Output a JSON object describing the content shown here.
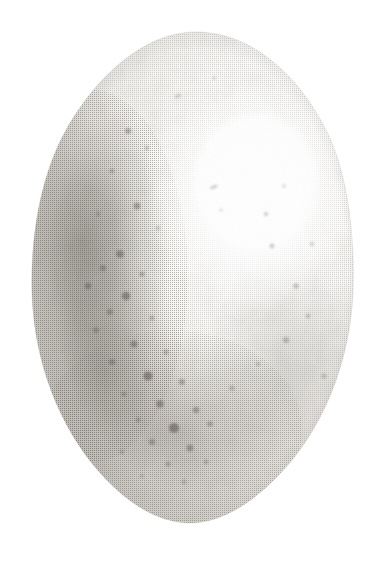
{
  "image": {
    "title": "Bird Egg Specimen Illustration",
    "subject": "egg",
    "style": "stipple engraving / halftone lithograph",
    "medium": "monochrome print",
    "caption": "",
    "background_color": "#ffffff",
    "canvas": {
      "width": 381,
      "height": 563
    }
  },
  "egg": {
    "name": "egg-body",
    "outline": {
      "top_y": 32,
      "bottom_y": 523,
      "left_x": 32,
      "right_x": 353,
      "widest_y": 300,
      "apex_x": 196,
      "base_x": 190,
      "shape": "ovoid, narrow rounded apex at top, broad rounded base at bottom"
    },
    "shell_base_color": "#e9e7e3",
    "ink_color": "#585550",
    "lighting": {
      "source": "upper right",
      "highlight_center_x": 252,
      "highlight_center_y": 196,
      "highlight_radius_x": 105,
      "highlight_radius_y": 115,
      "highlight_color": "#ffffff"
    },
    "shadow": {
      "name": "left-limb-shadow",
      "center_x": 78,
      "center_y": 240,
      "darkest_value": "#9a968f",
      "description": "deep graded shadow down the left limb, fading toward base"
    },
    "terminator": {
      "description": "soft diagonal tonal transition running from upper-left shoulder down to lower-right base"
    },
    "speckles": {
      "description": "irregular dark brown-grey maculations, densest over the lower-left and basal third, sparse near the apex and the highlight",
      "color_dark": "#5d564d",
      "color_mid": "#8a8279",
      "count": 46,
      "points": [
        {
          "x": 128,
          "y": 131,
          "r": 3.0,
          "o": 0.4
        },
        {
          "x": 147,
          "y": 148,
          "r": 2.0,
          "o": 0.3
        },
        {
          "x": 112,
          "y": 171,
          "r": 2.4,
          "o": 0.34
        },
        {
          "x": 137,
          "y": 206,
          "r": 3.4,
          "o": 0.46
        },
        {
          "x": 98,
          "y": 214,
          "r": 2.2,
          "o": 0.3
        },
        {
          "x": 158,
          "y": 228,
          "r": 2.0,
          "o": 0.28
        },
        {
          "x": 120,
          "y": 254,
          "r": 3.8,
          "o": 0.52
        },
        {
          "x": 103,
          "y": 268,
          "r": 3.0,
          "o": 0.44
        },
        {
          "x": 142,
          "y": 274,
          "r": 2.6,
          "o": 0.38
        },
        {
          "x": 88,
          "y": 286,
          "r": 3.2,
          "o": 0.48
        },
        {
          "x": 126,
          "y": 296,
          "r": 4.2,
          "o": 0.55
        },
        {
          "x": 110,
          "y": 312,
          "r": 3.0,
          "o": 0.42
        },
        {
          "x": 152,
          "y": 318,
          "r": 2.4,
          "o": 0.34
        },
        {
          "x": 96,
          "y": 330,
          "r": 2.8,
          "o": 0.4
        },
        {
          "x": 134,
          "y": 344,
          "r": 3.6,
          "o": 0.5
        },
        {
          "x": 166,
          "y": 352,
          "r": 2.6,
          "o": 0.36
        },
        {
          "x": 112,
          "y": 362,
          "r": 3.0,
          "o": 0.44
        },
        {
          "x": 148,
          "y": 376,
          "r": 4.6,
          "o": 0.58
        },
        {
          "x": 182,
          "y": 382,
          "r": 3.0,
          "o": 0.42
        },
        {
          "x": 124,
          "y": 394,
          "r": 2.6,
          "o": 0.36
        },
        {
          "x": 160,
          "y": 404,
          "r": 3.8,
          "o": 0.52
        },
        {
          "x": 196,
          "y": 410,
          "r": 3.2,
          "o": 0.44
        },
        {
          "x": 138,
          "y": 420,
          "r": 2.4,
          "o": 0.34
        },
        {
          "x": 174,
          "y": 428,
          "r": 5.0,
          "o": 0.6
        },
        {
          "x": 210,
          "y": 424,
          "r": 2.8,
          "o": 0.38
        },
        {
          "x": 152,
          "y": 442,
          "r": 3.0,
          "o": 0.42
        },
        {
          "x": 190,
          "y": 448,
          "r": 3.4,
          "o": 0.46
        },
        {
          "x": 122,
          "y": 452,
          "r": 2.2,
          "o": 0.3
        },
        {
          "x": 168,
          "y": 464,
          "r": 2.6,
          "o": 0.34
        },
        {
          "x": 206,
          "y": 462,
          "r": 2.4,
          "o": 0.32
        },
        {
          "x": 142,
          "y": 476,
          "r": 2.0,
          "o": 0.28
        },
        {
          "x": 184,
          "y": 482,
          "r": 2.2,
          "o": 0.3
        },
        {
          "x": 232,
          "y": 388,
          "r": 2.6,
          "o": 0.34
        },
        {
          "x": 258,
          "y": 364,
          "r": 2.2,
          "o": 0.3
        },
        {
          "x": 286,
          "y": 340,
          "r": 3.0,
          "o": 0.36
        },
        {
          "x": 308,
          "y": 316,
          "r": 2.4,
          "o": 0.3
        },
        {
          "x": 296,
          "y": 286,
          "r": 2.8,
          "o": 0.32
        },
        {
          "x": 272,
          "y": 246,
          "r": 2.4,
          "o": 0.3
        },
        {
          "x": 266,
          "y": 214,
          "r": 2.2,
          "o": 0.28
        },
        {
          "x": 284,
          "y": 186,
          "r": 1.8,
          "o": 0.24
        },
        {
          "x": 221,
          "y": 210,
          "r": 1.6,
          "o": 0.22
        },
        {
          "x": 214,
          "y": 187,
          "r": 2.0,
          "o": 0.26
        },
        {
          "x": 178,
          "y": 96,
          "r": 2.0,
          "o": 0.26
        },
        {
          "x": 214,
          "y": 78,
          "r": 1.8,
          "o": 0.22
        },
        {
          "x": 312,
          "y": 244,
          "r": 2.2,
          "o": 0.26
        },
        {
          "x": 324,
          "y": 376,
          "r": 2.6,
          "o": 0.3
        }
      ]
    },
    "texture": {
      "name": "stipple-halftone-grain",
      "description": "fine regular dot screen characteristic of 19th-century halftone engraving",
      "dot_pitch_px": 2,
      "dot_color": "#4a4640"
    }
  }
}
